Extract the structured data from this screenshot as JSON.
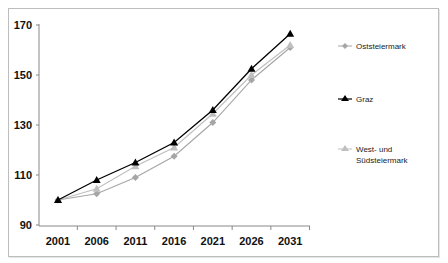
{
  "chart_data": {
    "type": "line",
    "title": "",
    "xlabel": "",
    "ylabel": "",
    "x": [
      "2001",
      "2006",
      "2011",
      "2016",
      "2021",
      "2026",
      "2031"
    ],
    "ylim": [
      90,
      170
    ],
    "yticks": [
      90,
      110,
      130,
      150,
      170
    ],
    "grid": false,
    "legend_position": "right",
    "series": [
      {
        "name": "Oststeiermark",
        "marker": "diamond",
        "color": "#a6a6a6",
        "values": [
          100,
          102.5,
          109,
          117.5,
          131,
          148,
          161
        ]
      },
      {
        "name": "Graz",
        "marker": "triangle",
        "color": "#000000",
        "values": [
          100,
          108,
          115,
          123,
          136,
          152.5,
          166.5
        ]
      },
      {
        "name": "West- und Südsteiermark",
        "marker": "triangle",
        "color": "#bfbfbf",
        "values": [
          100,
          104.5,
          113.5,
          121,
          134.5,
          150,
          162
        ]
      }
    ]
  },
  "legend": {
    "items": [
      {
        "label": "Oststeiermark"
      },
      {
        "label": "Graz"
      },
      {
        "label_line1": "West- und",
        "label_line2": "Südsteiermark"
      }
    ]
  },
  "axis": {
    "y_labels": [
      "170",
      "150",
      "130",
      "110",
      "90"
    ],
    "x_labels": [
      "2001",
      "2006",
      "2011",
      "2016",
      "2021",
      "2026",
      "2031"
    ]
  }
}
